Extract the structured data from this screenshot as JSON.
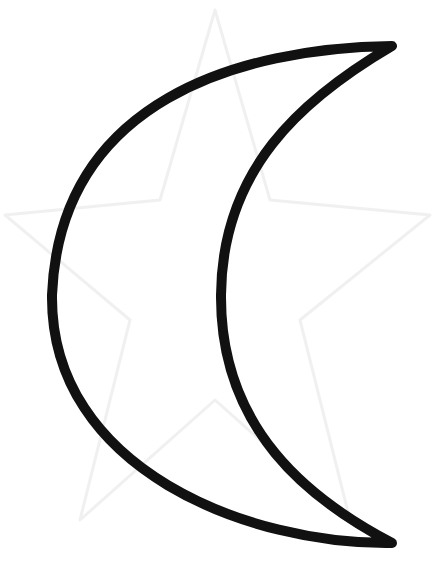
{
  "image": {
    "subject": "crescent moon outline",
    "background_color": "#ffffff",
    "stroke_color": "#111111",
    "watermark_color": "#ececec",
    "watermark_shape": "star"
  }
}
